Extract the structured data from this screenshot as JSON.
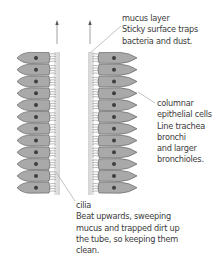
{
  "diagram": {
    "colors": {
      "cell_fill": "#a9a9a9",
      "cell_stroke": "#555555",
      "nucleus": "#3e3e3e",
      "mucus": "#d9d9d9",
      "cilia": "#7a7a7a",
      "leader_line": "#8a8a8a",
      "arrow": "#777777",
      "text": "#3c3c3c"
    },
    "cell_count_per_side": 12,
    "flow_arrows": [
      "up",
      "up"
    ],
    "labels": {
      "mucus": {
        "title": "mucus layer",
        "lines": [
          "Sticky surface traps",
          "bacteria and dust."
        ]
      },
      "epithelial": {
        "title": "columnar",
        "lines": [
          "epithelial cells",
          "Line trachea",
          "bronchi",
          "and larger",
          "bronchioles."
        ]
      },
      "cilia": {
        "title": "cilia",
        "lines": [
          "Beat upwards, sweeping",
          "mucus and trapped dirt up",
          "the tube, so keeping them",
          "clean."
        ]
      }
    }
  }
}
